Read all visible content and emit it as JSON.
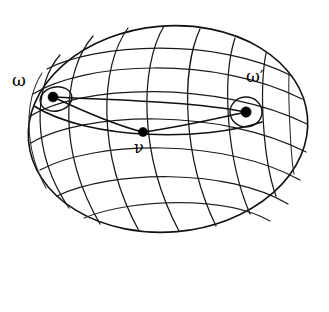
{
  "figure": {
    "kind": "ellipsoid-geodesic-diagram",
    "background_color": "#ffffff",
    "line_color": "#1a1a1a",
    "point_color": "#000000",
    "canvas": {
      "width": 329,
      "height": 312
    }
  },
  "surface": {
    "name": "ellipsoid-outline",
    "center_x": 168,
    "center_y": 129,
    "radius_x": 140,
    "radius_y": 103,
    "tilt_degrees": -5,
    "meridian_count": 9,
    "parallel_count": 7
  },
  "labels": {
    "omega": "ω",
    "omega_prime": "ω′",
    "nu": "ν"
  },
  "points": [
    {
      "id": "omega",
      "label": "ω",
      "x": 53,
      "y": 97,
      "radius": 5.0,
      "has_cap_circle": true,
      "cap_radius": 14
    },
    {
      "id": "nu",
      "label": "ν",
      "x": 143,
      "y": 132,
      "radius": 4.6,
      "has_cap_circle": false,
      "cap_radius": 0
    },
    {
      "id": "omega_prime",
      "label": "ω′",
      "x": 246,
      "y": 112,
      "radius": 5.2,
      "has_cap_circle": true,
      "cap_radius": 15
    }
  ],
  "geodesics": [
    {
      "id": "omega-to-nu",
      "from": "omega",
      "to": "nu"
    },
    {
      "id": "nu-to-omega-prime",
      "from": "nu",
      "to": "omega_prime"
    },
    {
      "id": "omega-to-omega-prime",
      "from": "omega",
      "to": "omega_prime"
    }
  ]
}
